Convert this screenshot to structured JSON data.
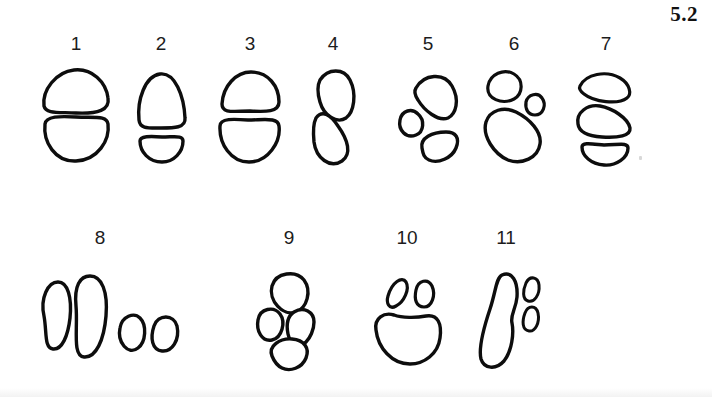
{
  "figure": {
    "label": "5.2",
    "background_color": "#ffffff",
    "ink_color": "#0d0d0d",
    "width": 712,
    "height": 397
  },
  "rows": [
    {
      "name": "top-row",
      "specimen_numbers": [
        "1",
        "2",
        "3",
        "4",
        "5",
        "6",
        "7"
      ]
    },
    {
      "name": "bottom-row",
      "specimen_numbers": [
        "8",
        "9",
        "10",
        "11"
      ]
    }
  ],
  "specimens": [
    {
      "number": "1",
      "row": "top-row",
      "label_x": 70,
      "label_y": 34,
      "art_x": 36,
      "art_y": 62,
      "art_w": 80,
      "art_h": 106,
      "lobe_count": 2,
      "description": "two stacked rounded lobes, wide dome above a broad rounded pad"
    },
    {
      "number": "2",
      "row": "top-row",
      "label_x": 156,
      "label_y": 34,
      "art_x": 128,
      "art_y": 62,
      "art_w": 66,
      "art_h": 106,
      "lobe_count": 2,
      "description": "narrow triangular dome above a shallow crescent pad"
    },
    {
      "number": "3",
      "row": "top-row",
      "label_x": 242,
      "label_y": 34,
      "art_x": 212,
      "art_y": 62,
      "art_w": 76,
      "art_h": 106,
      "lobe_count": 2,
      "description": "flattened half-dome above a large heart-shaped pad"
    },
    {
      "number": "4",
      "row": "top-row",
      "label_x": 330,
      "label_y": 34,
      "art_x": 302,
      "art_y": 62,
      "art_w": 62,
      "art_h": 106,
      "lobe_count": 2,
      "description": "two elongated diagonal lobes offset in a staggered pair"
    },
    {
      "number": "5",
      "row": "top-row",
      "label_x": 420,
      "label_y": 34,
      "art_x": 392,
      "art_y": 62,
      "art_w": 72,
      "art_h": 106,
      "lobe_count": 3,
      "description": "large upper-right lobe, small left lobe, lower-right wedge lobe"
    },
    {
      "number": "6",
      "row": "top-row",
      "label_x": 508,
      "label_y": 34,
      "art_x": 478,
      "art_y": 62,
      "art_w": 72,
      "art_h": 106,
      "lobe_count": 3,
      "description": "two small upper lobes over a large pentagonal pad"
    },
    {
      "number": "7",
      "row": "top-row",
      "label_x": 600,
      "label_y": 34,
      "art_x": 572,
      "art_y": 62,
      "art_w": 68,
      "art_h": 106,
      "lobe_count": 3,
      "description": "three stacked horizontal lobes, crescent at the base"
    },
    {
      "number": "8",
      "row": "bottom-row",
      "label_x": 100,
      "label_y": 228,
      "art_x": 28,
      "art_y": 268,
      "art_w": 152,
      "art_h": 100,
      "lobe_count": 4,
      "description": "two tall vertical ovals beside two small rounded pads"
    },
    {
      "number": "9",
      "row": "bottom-row",
      "label_x": 284,
      "label_y": 228,
      "art_x": 252,
      "art_y": 268,
      "art_w": 74,
      "art_h": 100,
      "lobe_count": 4,
      "description": "one upper lobe, two middle lobes, one lower lobe in a rosette"
    },
    {
      "number": "10",
      "row": "bottom-row",
      "label_x": 404,
      "label_y": 228,
      "art_x": 368,
      "art_y": 268,
      "art_w": 78,
      "art_h": 100,
      "lobe_count": 3,
      "description": "two small slanted toe lobes over a large rounded pad"
    },
    {
      "number": "11",
      "row": "bottom-row",
      "label_x": 508,
      "label_y": 228,
      "art_x": 470,
      "art_y": 265,
      "art_w": 72,
      "art_h": 108,
      "lobe_count": 3,
      "description": "long narrow elongated sole with two small ovals at upper right"
    }
  ]
}
